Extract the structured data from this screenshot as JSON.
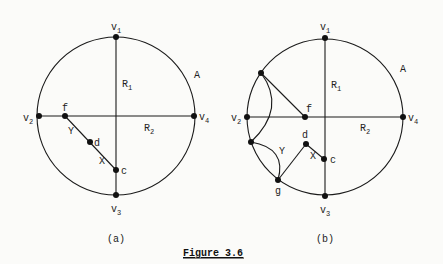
{
  "figure": {
    "title": "Figure 3.6",
    "panels": [
      {
        "id": "a",
        "caption": "(a)",
        "circle": {
          "cx": 116,
          "cy": 116,
          "r": 79
        },
        "vertices": [
          {
            "name": "v1",
            "label": "v",
            "sub": "1",
            "x": 116,
            "y": 37
          },
          {
            "name": "v2",
            "label": "v",
            "sub": "2",
            "x": 39,
            "y": 116
          },
          {
            "name": "v3",
            "label": "v",
            "sub": "3",
            "x": 116,
            "y": 195
          },
          {
            "name": "v4",
            "label": "v",
            "sub": "4",
            "x": 194,
            "y": 116
          },
          {
            "name": "f",
            "label": "f",
            "x": 65,
            "y": 116
          },
          {
            "name": "d",
            "label": "d",
            "x": 90,
            "y": 142
          },
          {
            "name": "c",
            "label": "c",
            "x": 116,
            "y": 170
          }
        ],
        "region_labels": [
          {
            "text": "R",
            "sub": "1",
            "x": 122,
            "y": 87
          },
          {
            "text": "R",
            "sub": "2",
            "x": 144,
            "y": 131
          },
          {
            "text": "A",
            "x": 194,
            "y": 78
          },
          {
            "text": "Y",
            "x": 69,
            "y": 135
          },
          {
            "text": "X",
            "x": 99,
            "y": 164
          }
        ]
      },
      {
        "id": "b",
        "caption": "(b)",
        "circle": {
          "cx": 325,
          "cy": 117,
          "r": 78
        },
        "vertices": [
          {
            "name": "v1",
            "label": "v",
            "sub": "1",
            "x": 325,
            "y": 38
          },
          {
            "name": "v2",
            "label": "v",
            "sub": "2",
            "x": 247,
            "y": 117
          },
          {
            "name": "v3",
            "label": "v",
            "sub": "3",
            "x": 325,
            "y": 196
          },
          {
            "name": "v4",
            "label": "v",
            "sub": "4",
            "x": 403,
            "y": 117
          },
          {
            "name": "p",
            "label": "",
            "x": 261,
            "y": 73
          },
          {
            "name": "f",
            "label": "f",
            "x": 305,
            "y": 117
          },
          {
            "name": "q",
            "label": "",
            "x": 251,
            "y": 142
          },
          {
            "name": "g",
            "label": "g",
            "x": 278,
            "y": 180
          },
          {
            "name": "d",
            "label": "d",
            "x": 306,
            "y": 144
          },
          {
            "name": "c",
            "label": "c",
            "x": 324,
            "y": 159
          }
        ],
        "region_labels": [
          {
            "text": "R",
            "sub": "1",
            "x": 331,
            "y": 88
          },
          {
            "text": "R",
            "sub": "2",
            "x": 360,
            "y": 131
          },
          {
            "text": "A",
            "x": 400,
            "y": 72
          },
          {
            "text": "Y",
            "x": 280,
            "y": 155
          },
          {
            "text": "X",
            "x": 311,
            "y": 158
          }
        ]
      }
    ]
  }
}
